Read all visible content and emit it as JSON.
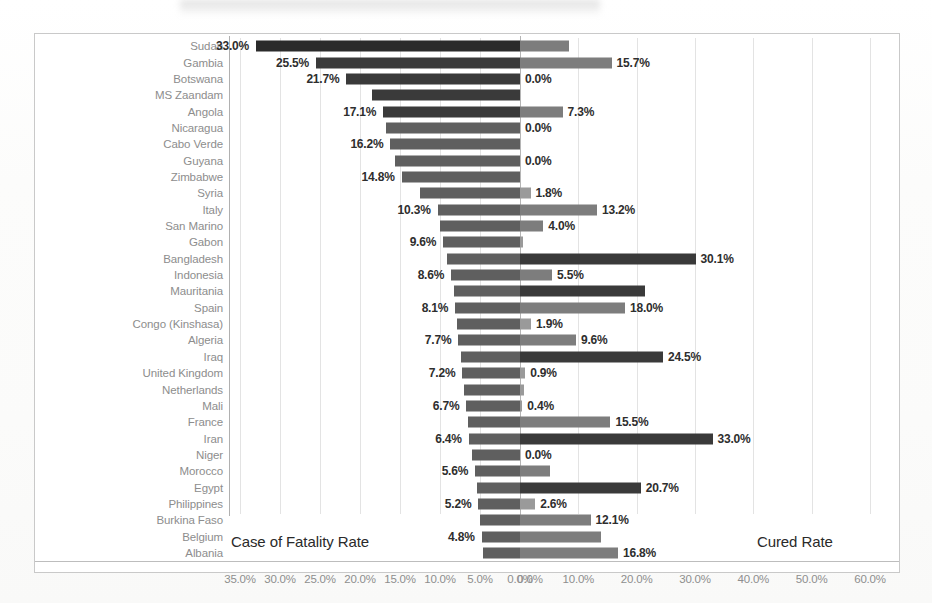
{
  "chart_data": {
    "type": "bar",
    "subtype": "diverging-butterfly",
    "title": "",
    "xlabel": "",
    "ylabel": "",
    "grid": true,
    "legend_position": "in-plot",
    "annotations": [
      {
        "text": "Case of Fatality Rate",
        "side": "left"
      },
      {
        "text": "Cured Rate",
        "side": "right"
      }
    ],
    "left_axis": {
      "name": "Case of Fatality Rate",
      "ticks": [
        "35.0%",
        "30.0%",
        "25.0%",
        "20.0%",
        "15.0%",
        "10.0%",
        "5.0%",
        "0.0%"
      ],
      "tick_values": [
        35.0,
        30.0,
        25.0,
        20.0,
        15.0,
        10.0,
        5.0,
        0.0
      ],
      "range": [
        35.0,
        0.0
      ],
      "direction": "right-to-left"
    },
    "right_axis": {
      "name": "Cured Rate",
      "ticks": [
        "0.0%",
        "10.0%",
        "20.0%",
        "30.0%",
        "40.0%",
        "50.0%",
        "60.0%"
      ],
      "tick_values": [
        0.0,
        10.0,
        20.0,
        30.0,
        40.0,
        50.0,
        60.0
      ],
      "range": [
        0.0,
        60.0
      ],
      "direction": "left-to-right"
    },
    "categories": [
      "Sudan",
      "Gambia",
      "Botswana",
      "MS Zaandam",
      "Angola",
      "Nicaragua",
      "Cabo Verde",
      "Guyana",
      "Zimbabwe",
      "Syria",
      "Italy",
      "San Marino",
      "Gabon",
      "Bangladesh",
      "Indonesia",
      "Mauritania",
      "Spain",
      "Congo (Kinshasa)",
      "Algeria",
      "Iraq",
      "United Kingdom",
      "Netherlands",
      "Mali",
      "France",
      "Iran",
      "Niger",
      "Morocco",
      "Egypt",
      "Philippines",
      "Burkina Faso",
      "Belgium",
      "Albania"
    ],
    "series": [
      {
        "name": "Case of Fatality Rate",
        "axis": "left",
        "values": [
          33.0,
          25.5,
          21.7,
          18.5,
          17.1,
          16.8,
          16.2,
          15.6,
          14.8,
          12.5,
          10.3,
          10.0,
          9.6,
          9.1,
          8.6,
          8.3,
          8.1,
          7.9,
          7.7,
          7.4,
          7.2,
          7.0,
          6.7,
          6.5,
          6.4,
          6.0,
          5.6,
          5.4,
          5.2,
          5.0,
          4.8,
          4.6
        ],
        "labels": [
          "33.0%",
          "",
          "21.7%",
          "",
          "17.1%",
          "",
          "16.2%",
          "",
          "14.8%",
          "",
          "10.3%",
          "",
          "9.6%",
          "",
          "8.6%",
          "",
          "8.1%",
          "",
          "7.7%",
          "",
          "7.2%",
          "",
          "6.7%",
          "",
          "6.4%",
          "",
          "5.6%",
          "",
          "5.2%",
          "",
          "4.8%",
          ""
        ],
        "labels_alt": [
          "",
          "25.5%",
          "",
          "",
          "",
          "",
          "",
          "",
          "",
          "",
          "",
          "",
          "",
          "",
          "",
          "",
          "",
          "",
          "",
          "",
          "",
          "",
          "",
          "",
          "",
          "",
          "",
          "",
          "",
          "",
          "",
          ""
        ]
      },
      {
        "name": "Cured Rate",
        "axis": "right",
        "values": [
          8.4,
          15.7,
          0.0,
          0.0,
          7.3,
          0.0,
          0.0,
          0.0,
          0.0,
          1.8,
          13.2,
          4.0,
          0.5,
          30.1,
          5.5,
          21.5,
          18.0,
          1.9,
          9.6,
          24.5,
          0.9,
          0.6,
          0.4,
          15.5,
          33.0,
          0.0,
          5.1,
          20.7,
          2.6,
          12.1,
          13.8,
          16.8
        ],
        "labels": [
          "",
          "15.7%",
          "0.0%",
          "",
          "7.3%",
          "0.0%",
          "",
          "0.0%",
          "",
          "1.8%",
          "13.2%",
          "4.0%",
          "",
          "30.1%",
          "5.5%",
          "",
          "18.0%",
          "1.9%",
          "9.6%",
          "24.5%",
          "0.9%",
          "",
          "0.4%",
          "15.5%",
          "33.0%",
          "0.0%",
          "",
          "20.7%",
          "2.6%",
          "12.1%",
          "",
          "16.8%"
        ]
      }
    ]
  },
  "colors": {
    "left_bar": "#5f5f5f",
    "right_bar": "#7d7d7d",
    "dark_bar": "#3a3a3a",
    "grid": "#e3e3e3",
    "axis_text": "#8e8e8e",
    "data_label_text": "#2e2e2e",
    "frame": "#c9c9c9",
    "background": "#ffffff"
  }
}
